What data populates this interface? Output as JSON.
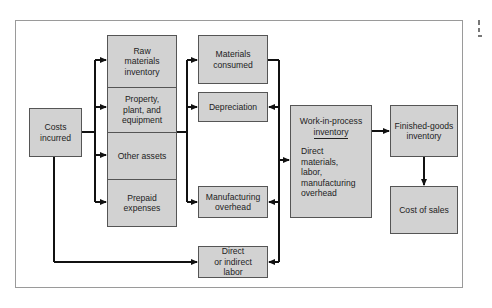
{
  "diagram": {
    "type": "flowchart",
    "nodes": {
      "costs_incurred": "Costs\nincurred",
      "raw_materials": "Raw\nmaterials\ninventory",
      "ppe": "Property,\nplant, and\nequipment",
      "other_assets": "Other assets",
      "prepaid": "Prepaid\nexpenses",
      "materials_consumed": "Materials\nconsumed",
      "depreciation": "Depreciation",
      "mfg_overhead": "Manufacturing\noverhead",
      "direct_labor": "Direct\nor indirect\nlabor",
      "wip_title": "Work-in-process",
      "wip_title2": "inventory",
      "wip_body": "Direct\nmaterials,\nlabor,\nmanufacturing\noverhead",
      "finished_goods": "Finished-goods\ninventory",
      "cost_of_sales": "Cost of sales"
    },
    "edges": [
      [
        "Costs incurred",
        "Raw materials inventory"
      ],
      [
        "Costs incurred",
        "Property, plant, and equipment"
      ],
      [
        "Costs incurred",
        "Other assets"
      ],
      [
        "Costs incurred",
        "Prepaid expenses"
      ],
      [
        "Costs incurred",
        "Direct or indirect labor"
      ],
      [
        "Asset stack",
        "Materials consumed"
      ],
      [
        "Asset stack",
        "Depreciation"
      ],
      [
        "Asset stack",
        "Manufacturing overhead"
      ],
      [
        "Materials consumed",
        "Work-in-process inventory"
      ],
      [
        "Depreciation",
        "Work-in-process inventory"
      ],
      [
        "Manufacturing overhead",
        "Work-in-process inventory"
      ],
      [
        "Direct or indirect labor",
        "Work-in-process inventory"
      ],
      [
        "Work-in-process inventory",
        "Finished-goods inventory"
      ],
      [
        "Finished-goods inventory",
        "Cost of sales"
      ]
    ],
    "colors": {
      "box_fill": "#d2d2d2",
      "line": "#111111",
      "frame": "#9a9a9a"
    }
  }
}
